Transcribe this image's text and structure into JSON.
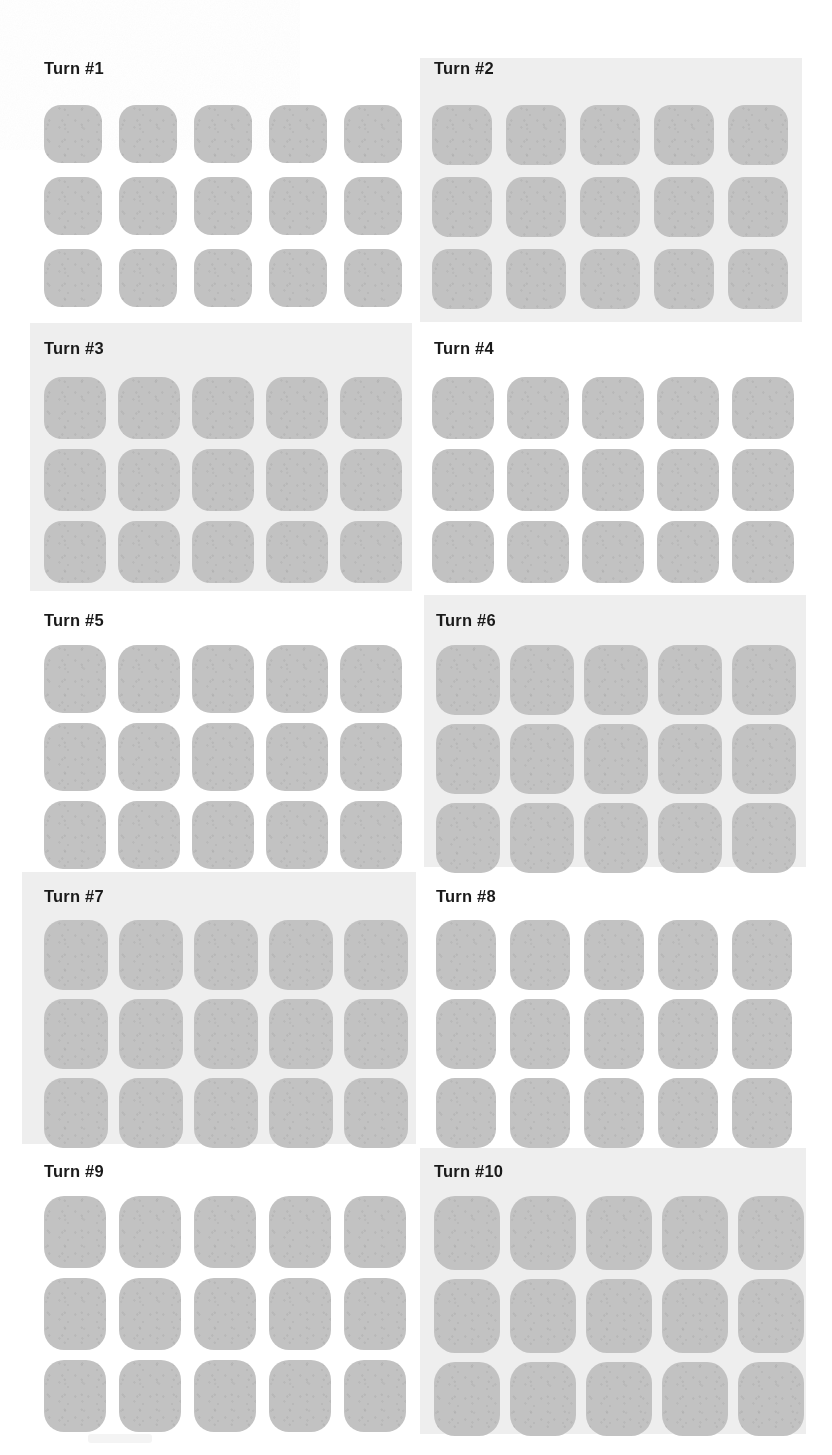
{
  "page": {
    "width": 832,
    "height": 1455,
    "background_color": "#ffffff",
    "shaded_panel_color": "#eeeeee",
    "tile_color": "#c2c2c2",
    "title_color": "#1a1a1a"
  },
  "grid_layout": {
    "columns": 2,
    "rows": 5,
    "tiles_per_panel_columns": 5,
    "tiles_per_panel_rows": 3
  },
  "panels": [
    {
      "title": "Turn #1",
      "index": 1,
      "background": "plain",
      "panel_x": 0,
      "panel_y": 0,
      "panel_w": 416,
      "panel_h": 320,
      "title_x": 44,
      "title_y": 60,
      "grid_x": 44,
      "grid_y": 105,
      "tile_w": 58,
      "tile_h": 58,
      "gap_x": 17,
      "gap_y": 14,
      "radius": 17
    },
    {
      "title": "Turn #2",
      "index": 2,
      "background": "shaded",
      "panel_x": 420,
      "panel_y": 58,
      "panel_w": 382,
      "panel_h": 264,
      "title_x": 434,
      "title_y": 60,
      "grid_x": 432,
      "grid_y": 105,
      "tile_w": 60,
      "tile_h": 60,
      "gap_x": 14,
      "gap_y": 12,
      "radius": 17
    },
    {
      "title": "Turn #3",
      "index": 3,
      "background": "shaded",
      "panel_x": 30,
      "panel_y": 323,
      "panel_w": 382,
      "panel_h": 268,
      "title_x": 44,
      "title_y": 340,
      "grid_x": 44,
      "grid_y": 377,
      "tile_w": 62,
      "tile_h": 62,
      "gap_x": 12,
      "gap_y": 10,
      "radius": 18
    },
    {
      "title": "Turn #4",
      "index": 4,
      "background": "plain",
      "panel_x": 416,
      "panel_y": 323,
      "panel_w": 416,
      "panel_h": 268,
      "title_x": 434,
      "title_y": 340,
      "grid_x": 432,
      "grid_y": 377,
      "tile_w": 62,
      "tile_h": 62,
      "gap_x": 13,
      "gap_y": 10,
      "radius": 18
    },
    {
      "title": "Turn #5",
      "index": 5,
      "background": "plain",
      "panel_x": 0,
      "panel_y": 595,
      "panel_w": 416,
      "panel_h": 272,
      "title_x": 44,
      "title_y": 612,
      "grid_x": 44,
      "grid_y": 645,
      "tile_w": 62,
      "tile_h": 68,
      "gap_x": 12,
      "gap_y": 10,
      "radius": 19
    },
    {
      "title": "Turn #6",
      "index": 6,
      "background": "shaded",
      "panel_x": 424,
      "panel_y": 595,
      "panel_w": 382,
      "panel_h": 272,
      "title_x": 436,
      "title_y": 612,
      "grid_x": 436,
      "grid_y": 645,
      "tile_w": 64,
      "tile_h": 70,
      "gap_x": 10,
      "gap_y": 9,
      "radius": 19
    },
    {
      "title": "Turn #7",
      "index": 7,
      "background": "shaded",
      "panel_x": 22,
      "panel_y": 872,
      "panel_w": 394,
      "panel_h": 272,
      "title_x": 44,
      "title_y": 888,
      "grid_x": 44,
      "grid_y": 920,
      "tile_w": 64,
      "tile_h": 70,
      "gap_x": 11,
      "gap_y": 9,
      "radius": 19
    },
    {
      "title": "Turn #8",
      "index": 8,
      "background": "plain",
      "panel_x": 416,
      "panel_y": 872,
      "panel_w": 416,
      "panel_h": 272,
      "title_x": 436,
      "title_y": 888,
      "grid_x": 436,
      "grid_y": 920,
      "tile_w": 60,
      "tile_h": 70,
      "gap_x": 14,
      "gap_y": 9,
      "radius": 19
    },
    {
      "title": "Turn #9",
      "index": 9,
      "background": "plain",
      "panel_x": 0,
      "panel_y": 1148,
      "panel_w": 416,
      "panel_h": 286,
      "title_x": 44,
      "title_y": 1163,
      "grid_x": 44,
      "grid_y": 1196,
      "tile_w": 62,
      "tile_h": 72,
      "gap_x": 13,
      "gap_y": 10,
      "radius": 20
    },
    {
      "title": "Turn #10",
      "index": 10,
      "background": "shaded",
      "panel_x": 420,
      "panel_y": 1148,
      "panel_w": 386,
      "panel_h": 286,
      "title_x": 434,
      "title_y": 1163,
      "grid_x": 434,
      "grid_y": 1196,
      "tile_w": 66,
      "tile_h": 74,
      "gap_x": 10,
      "gap_y": 9,
      "radius": 21
    }
  ]
}
